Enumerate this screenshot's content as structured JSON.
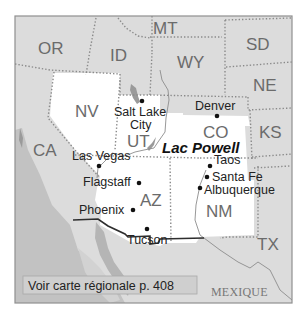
{
  "map": {
    "colors": {
      "background": "#ffffff",
      "other_states": "#dcdcdc",
      "highlighted_states": "#ffffff",
      "ocean": "#c6c6c6",
      "ocean_dark": "#b2b2b2",
      "frame": "#8f8f8f",
      "ref_box": "#cfcfcf"
    },
    "states": {
      "or": "OR",
      "id": "ID",
      "mt": "MT",
      "wy": "WY",
      "sd": "SD",
      "ne": "NE",
      "nv": "NV",
      "ut": "UT",
      "co": "CO",
      "ks": "KS",
      "ca": "CA",
      "az": "AZ",
      "nm": "NM",
      "tx": "TX"
    },
    "cities": {
      "salt_lake_city_line1": "Salt Lake",
      "salt_lake_city_line2": "City",
      "denver": "Denver",
      "las_vegas": "Las Vegas",
      "flagstaff": "Flagstaff",
      "phoenix": "Phoenix",
      "tucson": "Tucson",
      "taos": "Taos",
      "santa_fe": "Santa Fe",
      "albuquerque": "Albuquerque"
    },
    "highlight": "Lac Powell",
    "country": "MEXIQUE",
    "reference": "Voir carte régionale p. 408"
  }
}
